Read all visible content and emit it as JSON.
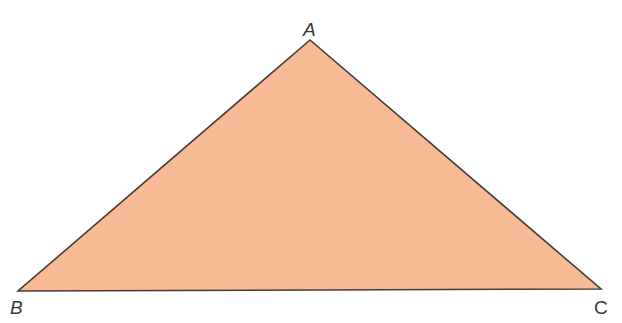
{
  "diagram": {
    "type": "triangle",
    "fill_color": "#F6BA95",
    "stroke_color": "#4a3c34",
    "vertices": [
      {
        "label": "A",
        "x": 310,
        "y": 40
      },
      {
        "label": "B",
        "x": 18,
        "y": 291
      },
      {
        "label": "C",
        "x": 601,
        "y": 289
      }
    ]
  },
  "labels": {
    "a": "A",
    "b": "B",
    "c": "C"
  }
}
